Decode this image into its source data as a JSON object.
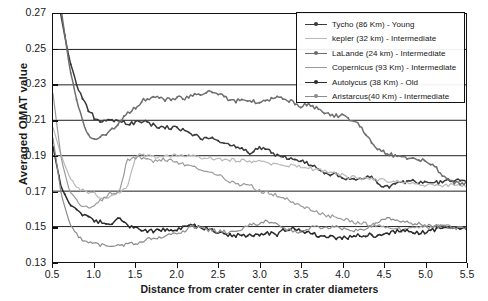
{
  "chart_data": {
    "type": "line",
    "title": "",
    "xlabel": "Distance from crater center in crater diameters",
    "ylabel": "Averaged OMAT value",
    "xlim": [
      0.5,
      5.5
    ],
    "ylim": [
      0.13,
      0.27
    ],
    "xticks": [
      "0.5",
      "1.0",
      "1.5",
      "2.0",
      "2.5",
      "3.0",
      "3.5",
      "4.0",
      "4.5",
      "5.0",
      "5.5"
    ],
    "yticks": [
      "0.13",
      "0.15",
      "0.17",
      "0.19",
      "0.21",
      "0.23",
      "0.25",
      "0.27"
    ],
    "grid": "horizontal",
    "legend_position": "top-right",
    "x": [
      0.5,
      0.6,
      0.7,
      0.8,
      0.9,
      1.0,
      1.1,
      1.2,
      1.3,
      1.4,
      1.5,
      1.6,
      1.7,
      1.8,
      1.9,
      2.0,
      2.1,
      2.2,
      2.3,
      2.4,
      2.5,
      2.6,
      2.7,
      2.8,
      2.9,
      3.0,
      3.1,
      3.2,
      3.3,
      3.4,
      3.5,
      3.6,
      3.7,
      3.8,
      3.9,
      4.0,
      4.1,
      4.2,
      4.3,
      4.4,
      4.5,
      4.6,
      4.7,
      4.8,
      4.9,
      5.0,
      5.1,
      5.2,
      5.3,
      5.4,
      5.5
    ],
    "series": [
      {
        "name": "Tycho (86 Km) - Young",
        "color": "#3a3a3a",
        "values": [
          0.3,
          0.268,
          0.244,
          0.228,
          0.218,
          0.2115,
          0.2095,
          0.21,
          0.2095,
          0.2085,
          0.2085,
          0.2095,
          0.2075,
          0.2055,
          0.206,
          0.206,
          0.204,
          0.2015,
          0.2,
          0.1995,
          0.1985,
          0.1975,
          0.196,
          0.193,
          0.1915,
          0.195,
          0.193,
          0.1905,
          0.189,
          0.188,
          0.187,
          0.185,
          0.1835,
          0.18,
          0.1795,
          0.178,
          0.177,
          0.176,
          0.179,
          0.176,
          0.172,
          0.173,
          0.1745,
          0.1755,
          0.1755,
          0.175,
          0.175,
          0.175,
          0.176,
          0.176,
          0.176
        ]
      },
      {
        "name": "kepler (32 km) - Intermediate",
        "color": "#b8b8b8",
        "values": [
          0.206,
          0.19,
          0.178,
          0.172,
          0.169,
          0.1685,
          0.166,
          0.1675,
          0.169,
          0.172,
          0.19,
          0.1905,
          0.19,
          0.1895,
          0.19,
          0.1905,
          0.19,
          0.1895,
          0.189,
          0.1885,
          0.188,
          0.188,
          0.1875,
          0.1875,
          0.187,
          0.1865,
          0.186,
          0.1855,
          0.185,
          0.1845,
          0.184,
          0.183,
          0.182,
          0.181,
          0.18,
          0.179,
          0.178,
          0.1775,
          0.177,
          0.1765,
          0.176,
          0.1755,
          0.175,
          0.1745,
          0.174,
          0.1735,
          0.173,
          0.173,
          0.173,
          0.173,
          0.173
        ]
      },
      {
        "name": "LaLande (24 km) - Intermediate",
        "color": "#6e6e6e",
        "values": [
          0.31,
          0.272,
          0.24,
          0.218,
          0.2035,
          0.199,
          0.201,
          0.2045,
          0.209,
          0.2135,
          0.2175,
          0.2215,
          0.223,
          0.2225,
          0.2215,
          0.223,
          0.2225,
          0.2245,
          0.224,
          0.226,
          0.225,
          0.2225,
          0.221,
          0.221,
          0.2205,
          0.22,
          0.2215,
          0.223,
          0.2225,
          0.2205,
          0.218,
          0.219,
          0.2165,
          0.214,
          0.2125,
          0.2125,
          0.21,
          0.2075,
          0.201,
          0.1955,
          0.192,
          0.1905,
          0.1895,
          0.189,
          0.188,
          0.187,
          0.185,
          0.18,
          0.176,
          0.1745,
          0.1745
        ]
      },
      {
        "name": "Copernicus (93 Km) - Intermediate",
        "color": "#9a9a9a",
        "values": [
          0.225,
          0.188,
          0.17,
          0.164,
          0.1605,
          0.162,
          0.1655,
          0.169,
          0.17,
          0.1875,
          0.189,
          0.188,
          0.187,
          0.188,
          0.1875,
          0.1865,
          0.185,
          0.184,
          0.1825,
          0.18,
          0.179,
          0.176,
          0.174,
          0.1735,
          0.173,
          0.17,
          0.169,
          0.168,
          0.166,
          0.164,
          0.162,
          0.16,
          0.158,
          0.1565,
          0.1555,
          0.1545,
          0.153,
          0.152,
          0.1515,
          0.151,
          0.15,
          0.149,
          0.1485,
          0.1485,
          0.149,
          0.1495,
          0.15,
          0.1505,
          0.15,
          0.149,
          0.149
        ]
      },
      {
        "name": "Autolycus (38 Km) - Old",
        "color": "#2b2b2b",
        "values": [
          0.195,
          0.172,
          0.163,
          0.1585,
          0.1555,
          0.1535,
          0.152,
          0.151,
          0.156,
          0.151,
          0.149,
          0.148,
          0.1475,
          0.148,
          0.1485,
          0.148,
          0.15,
          0.1505,
          0.1495,
          0.148,
          0.1465,
          0.1455,
          0.145,
          0.145,
          0.145,
          0.1455,
          0.1465,
          0.145,
          0.148,
          0.149,
          0.148,
          0.1465,
          0.145,
          0.1445,
          0.144,
          0.1435,
          0.144,
          0.145,
          0.1455,
          0.145,
          0.1455,
          0.147,
          0.1475,
          0.148,
          0.1465,
          0.147,
          0.148,
          0.149,
          0.1495,
          0.149,
          0.149
        ]
      },
      {
        "name": "Aristarcus(40 Km) - Intermediate",
        "color": "#8c8c8c",
        "values": [
          0.2,
          0.168,
          0.152,
          0.145,
          0.1415,
          0.14,
          0.1395,
          0.139,
          0.1395,
          0.14,
          0.1405,
          0.142,
          0.143,
          0.144,
          0.145,
          0.146,
          0.148,
          0.15,
          0.149,
          0.148,
          0.1475,
          0.147,
          0.1475,
          0.149,
          0.151,
          0.1515,
          0.153,
          0.151,
          0.149,
          0.148,
          0.147,
          0.149,
          0.15,
          0.1495,
          0.15,
          0.149,
          0.148,
          0.1475,
          0.149,
          0.151,
          0.154,
          0.1545,
          0.153,
          0.152,
          0.1515,
          0.151,
          0.1505,
          0.15,
          0.1495,
          0.149,
          0.149
        ]
      }
    ]
  },
  "legend": {
    "items": [
      {
        "label": "Tycho (86 Km) -  Young",
        "color": "#3a3a3a",
        "marker": "line-dot-marker"
      },
      {
        "label": "kepler (32 km)  -  Intermediate",
        "color": "#b8b8b8",
        "marker": "line-marker"
      },
      {
        "label": "LaLande (24 km)  -  Intermediate",
        "color": "#6e6e6e",
        "marker": "line-dot-marker"
      },
      {
        "label": "Copernicus (93 Km) -  Intermediate",
        "color": "#9a9a9a",
        "marker": "line-marker"
      },
      {
        "label": "Autolycus (38 Km) -  Old",
        "color": "#2b2b2b",
        "marker": "line-dot-marker"
      },
      {
        "label": "Aristarcus(40 Km) -  Intermediate",
        "color": "#8c8c8c",
        "marker": "line-dot-marker"
      }
    ]
  }
}
